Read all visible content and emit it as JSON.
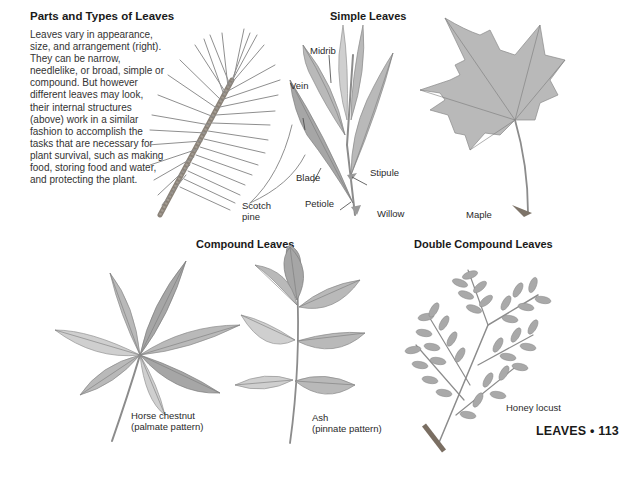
{
  "intro": {
    "title": "Parts and Types of Leaves",
    "body": "Leaves vary in appearance, size, and arrangement (right). They can be narrow, needlelike, or broad, simple or compound. But however different leaves may look, their internal structures (above) work in a similar fashion to accomplish the tasks that are necessary for plant survival, such as making food, storing food and water, and protecting the plant."
  },
  "simple_leaves": {
    "heading": "Simple Leaves",
    "scotch_pine": {
      "label_line1": "Scotch",
      "label_line2": "pine"
    },
    "willow": {
      "label": "Willow",
      "parts": {
        "midrib": "Midrib",
        "vein": "Vein",
        "blade": "Blade",
        "stipule": "Stipule",
        "petiole": "Petiole"
      }
    },
    "maple": {
      "label": "Maple"
    }
  },
  "compound_leaves": {
    "heading": "Compound Leaves",
    "horse_chestnut": {
      "label_line1": "Horse chestnut",
      "label_line2": "(palmate pattern)"
    },
    "ash": {
      "label_line1": "Ash",
      "label_line2": "(pinnate pattern)"
    }
  },
  "double_compound_leaves": {
    "heading": "Double Compound Leaves",
    "honey_locust": {
      "label": "Honey locust"
    }
  },
  "folio": {
    "section": "LEAVES",
    "separator": "•",
    "page": "113"
  },
  "colors": {
    "text": "#222222",
    "illustration_gray": "#b0b0b0",
    "background": "#ffffff"
  }
}
